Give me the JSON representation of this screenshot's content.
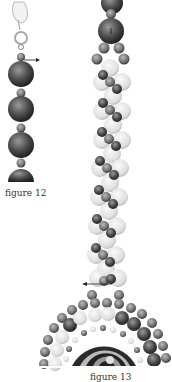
{
  "figures": [
    {
      "id": "fig12",
      "caption": "figure 12",
      "description": "clasp with strand of large and small beads, arrow pointing right"
    },
    {
      "id": "fig13",
      "caption": "figure 13",
      "description": "twisted bead rope leading to beaded bezel around spiral cabochon, arrow pointing left"
    }
  ],
  "colors": {
    "dark_bead": "#4a4a4a",
    "mid_bead": "#7a7a7a",
    "light_bead": "#dcdcdc",
    "outline": "#2a2a2a"
  }
}
